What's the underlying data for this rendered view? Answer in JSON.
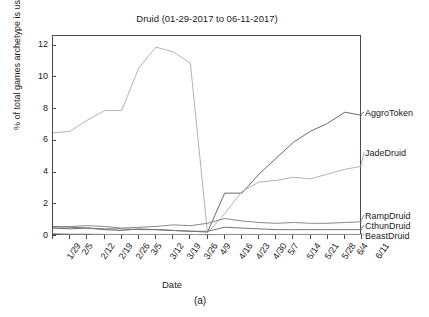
{
  "chart_data": {
    "type": "line",
    "title": "Druid (01-29-2017 to 06-11-2017)",
    "xlabel": "Date",
    "ylabel": "% of total games archetype is used",
    "caption": "(a)",
    "grid": false,
    "legend_position": "right-outside",
    "xlim": [
      0,
      19
    ],
    "ylim": [
      0,
      12.6
    ],
    "yticks": [
      0,
      2,
      4,
      6,
      8,
      10,
      12
    ],
    "categories": [
      "1/29",
      "2/5",
      "2/12",
      "2/19",
      "2/26",
      "3/5",
      "3/12",
      "3/19",
      "3/26",
      "4/9",
      "4/16",
      "4/23",
      "4/30",
      "5/7",
      "5/14",
      "5/21",
      "5/28",
      "6/4",
      "6/11"
    ],
    "series": [
      {
        "name": "AggroToken",
        "color": "#6b6b6b",
        "values": [
          0.5,
          0.45,
          0.5,
          0.4,
          0.35,
          0.45,
          0.4,
          0.35,
          0.3,
          0.25,
          2.7,
          2.7,
          3.9,
          4.9,
          5.9,
          6.6,
          7.1,
          7.8,
          7.6
        ]
      },
      {
        "name": "JadeDruid",
        "color": "#b3b3b3",
        "values": [
          6.5,
          6.6,
          7.3,
          7.9,
          7.9,
          10.6,
          11.9,
          11.6,
          10.9,
          0.2,
          1.4,
          2.8,
          3.4,
          3.5,
          3.7,
          3.6,
          3.9,
          4.2,
          4.4
        ]
      },
      {
        "name": "RampDruid",
        "color": "#8a8a8a",
        "values": [
          0.55,
          0.6,
          0.65,
          0.6,
          0.5,
          0.55,
          0.6,
          0.7,
          0.65,
          0.8,
          1.1,
          0.95,
          0.85,
          0.8,
          0.85,
          0.8,
          0.8,
          0.85,
          0.9
        ]
      },
      {
        "name": "CthunDruid",
        "color": "#777777",
        "values": [
          0.6,
          0.55,
          0.5,
          0.45,
          0.45,
          0.4,
          0.4,
          0.35,
          0.3,
          0.3,
          0.55,
          0.5,
          0.45,
          0.4,
          0.4,
          0.4,
          0.4,
          0.4,
          0.4
        ]
      },
      {
        "name": "BeastDruid",
        "color": "#9a9a9a",
        "values": [
          0.15,
          0.12,
          0.12,
          0.1,
          0.1,
          0.1,
          0.1,
          0.1,
          0.1,
          0.08,
          0.1,
          0.1,
          0.1,
          0.1,
          0.1,
          0.1,
          0.1,
          0.1,
          0.1
        ]
      }
    ],
    "legend_labels": [
      "AggroToken",
      "JadeDruid",
      "RampDruid",
      "CthunDruid",
      "BeastDruid"
    ]
  }
}
